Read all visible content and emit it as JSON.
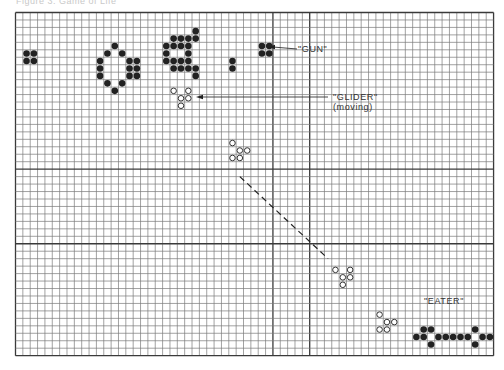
{
  "figure": {
    "caption_fragment": "Figure 3. Game of Life",
    "grid": {
      "cols": 65,
      "rows": 46,
      "origin_x": 15.5,
      "origin_y": 12.5,
      "cell_w": 7.355,
      "cell_h": 7.46,
      "heavy_cols": [
        35,
        40
      ],
      "heavy_rows": [
        21,
        31
      ],
      "line_color": "#7a7a7a",
      "border_color": "#3a3a3a"
    },
    "labels": {
      "gun": "\"GUN\"",
      "glider": "\"GLIDER\"",
      "glider_sub": "(moving)",
      "eater": "\"EATER\""
    },
    "live_cells": {
      "left_block": [
        [
          1,
          5
        ],
        [
          2,
          5
        ],
        [
          1,
          6
        ],
        [
          2,
          6
        ]
      ],
      "queen_bee": [
        [
          13,
          4
        ],
        [
          12,
          5
        ],
        [
          14,
          5
        ],
        [
          11,
          6
        ],
        [
          11,
          7
        ],
        [
          11,
          8
        ],
        [
          15,
          6
        ],
        [
          16,
          6
        ],
        [
          15,
          7
        ],
        [
          16,
          7
        ],
        [
          15,
          8
        ],
        [
          16,
          8
        ],
        [
          12,
          9
        ],
        [
          14,
          9
        ],
        [
          13,
          10
        ]
      ],
      "gun_cluster": [
        [
          24,
          2
        ],
        [
          21,
          3
        ],
        [
          22,
          3
        ],
        [
          23,
          3
        ],
        [
          24,
          3
        ],
        [
          20,
          4
        ],
        [
          21,
          4
        ],
        [
          22,
          4
        ],
        [
          23,
          4
        ],
        [
          20,
          5
        ],
        [
          23,
          5
        ],
        [
          20,
          6
        ],
        [
          21,
          6
        ],
        [
          22,
          6
        ],
        [
          23,
          6
        ],
        [
          21,
          7
        ],
        [
          22,
          7
        ],
        [
          23,
          7
        ],
        [
          24,
          7
        ],
        [
          24,
          8
        ]
      ],
      "small_pair": [
        [
          29,
          6
        ],
        [
          29,
          7
        ]
      ],
      "right_block": [
        [
          33,
          4
        ],
        [
          34,
          4
        ],
        [
          33,
          5
        ],
        [
          34,
          5
        ]
      ],
      "eater": [
        [
          55,
          42
        ],
        [
          54,
          43
        ],
        [
          55,
          43
        ],
        [
          57,
          43
        ],
        [
          58,
          43
        ],
        [
          59,
          43
        ],
        [
          60,
          43
        ],
        [
          61,
          43
        ],
        [
          63,
          43
        ],
        [
          64,
          43
        ],
        [
          56,
          44
        ],
        [
          62,
          44
        ],
        [
          56,
          42
        ],
        [
          62,
          42
        ]
      ]
    },
    "gliders": [
      [
        [
          21,
          10
        ],
        [
          22,
          11
        ],
        [
          23,
          10
        ],
        [
          23,
          11
        ],
        [
          22,
          12
        ]
      ],
      [
        [
          29,
          17
        ],
        [
          30,
          18
        ],
        [
          31,
          18
        ],
        [
          29,
          19
        ],
        [
          30,
          19
        ]
      ],
      [
        [
          43,
          34
        ],
        [
          45,
          34
        ],
        [
          44,
          35
        ],
        [
          45,
          35
        ],
        [
          44,
          36
        ]
      ],
      [
        [
          49,
          40
        ],
        [
          50,
          41
        ],
        [
          51,
          41
        ],
        [
          49,
          42
        ],
        [
          50,
          42
        ]
      ]
    ],
    "trajectory": {
      "from": [
        30.5,
        22
      ],
      "to": [
        42.5,
        33
      ]
    },
    "arrows": {
      "gun": {
        "from": [
          297,
          49
        ],
        "to": [
          268,
          47
        ]
      },
      "glider": {
        "from": [
          328,
          97
        ],
        "to": [
          196,
          97
        ]
      }
    }
  }
}
